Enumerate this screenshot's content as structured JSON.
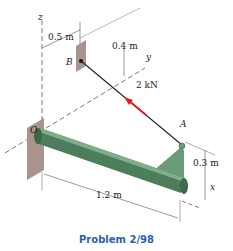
{
  "figure": {
    "caption": "Problem 2/98",
    "axes": {
      "z": "z",
      "y": "y",
      "x": "x"
    },
    "points": {
      "origin": "O",
      "anchor": "B",
      "end": "A"
    },
    "dimensions": {
      "b_offset": "0.5 m",
      "b_height": "0.4 m",
      "bracket_height": "0.3 m",
      "bar_length": "1.2 m"
    },
    "force": {
      "label": "2 kN",
      "color": "#e02020"
    },
    "colors": {
      "bar": "#4e7d5b",
      "wall": "#a9948d",
      "caption": "#2b5fad"
    }
  }
}
